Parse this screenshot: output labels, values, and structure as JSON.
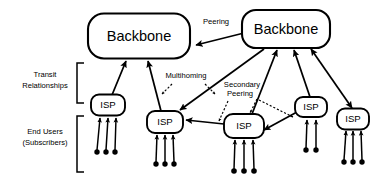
{
  "diagram": {
    "background_color": "#ffffff",
    "line_color": "#000000",
    "nodes": {
      "backbones": [
        {
          "id": "backbone-left",
          "label": "Backbone",
          "x": 139,
          "y": 36,
          "w": 102,
          "h": 45,
          "r": 16
        },
        {
          "id": "backbone-right",
          "label": "Backbone",
          "x": 286,
          "y": 29,
          "w": 88,
          "h": 38,
          "r": 14
        }
      ],
      "isps": [
        {
          "id": "isp-1",
          "label": "ISP",
          "x": 108,
          "y": 105,
          "w": 34,
          "h": 21,
          "r": 8,
          "subscribers": 3
        },
        {
          "id": "isp-2",
          "label": "ISP",
          "x": 165,
          "y": 122,
          "w": 36,
          "h": 22,
          "r": 8,
          "subscribers": 3
        },
        {
          "id": "isp-3",
          "label": "ISP",
          "x": 244,
          "y": 126,
          "w": 40,
          "h": 24,
          "r": 9,
          "subscribers": 3
        },
        {
          "id": "isp-4",
          "label": "ISP",
          "x": 311,
          "y": 107,
          "w": 32,
          "h": 20,
          "r": 8,
          "subscribers": 2
        },
        {
          "id": "isp-5",
          "label": "ISP",
          "x": 353,
          "y": 119,
          "w": 32,
          "h": 21,
          "r": 8,
          "subscribers": 3
        }
      ]
    },
    "annotations": [
      {
        "id": "peering",
        "label": "Peering",
        "x": 216,
        "y": 24
      },
      {
        "id": "multihoming",
        "label": "Multihoming",
        "x": 186,
        "y": 78
      },
      {
        "id": "secondary-peering-line1",
        "label": "Secondary",
        "x": 242,
        "y": 87
      },
      {
        "id": "secondary-peering-line2",
        "label": "Peering",
        "x": 240,
        "y": 96
      }
    ],
    "side_labels": [
      {
        "id": "transit-relationships-line1",
        "label": "Transit",
        "x": 45,
        "y": 77
      },
      {
        "id": "transit-relationships-line2",
        "label": "Relationships",
        "x": 45,
        "y": 88
      },
      {
        "id": "end-users-line1",
        "label": "End Users",
        "x": 45,
        "y": 134
      },
      {
        "id": "end-users-line2",
        "label": "(Subscribers)",
        "x": 45,
        "y": 145
      }
    ],
    "legend_notes": {
      "transit_bracket": "Transit Relationships bracket spans the backbone-to-ISP tier",
      "enduser_bracket": "End Users (Subscribers) bracket spans the subscriber tier"
    }
  }
}
